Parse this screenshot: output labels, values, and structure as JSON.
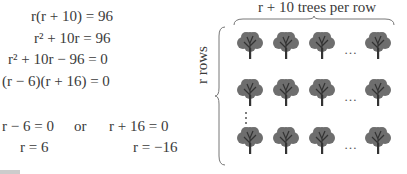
{
  "equations": {
    "line1": "r(r + 10) = 96",
    "line2": "r² + 10r = 96",
    "line3": "r² + 10r − 96 = 0",
    "line4": "(r − 6)(r + 16) = 0",
    "case1": "r − 6 = 0",
    "or": "or",
    "case2": "r + 16 = 0",
    "sol1": "r = 6",
    "sol2": "r = −16"
  },
  "diagram": {
    "top_label": "r + 10 trees per row",
    "side_label": "r rows",
    "ellipsis": "…",
    "rows": 3,
    "trees_per_row_shown": 4,
    "tree_color": "#6e6e6e",
    "trunk_color": "#333333"
  }
}
